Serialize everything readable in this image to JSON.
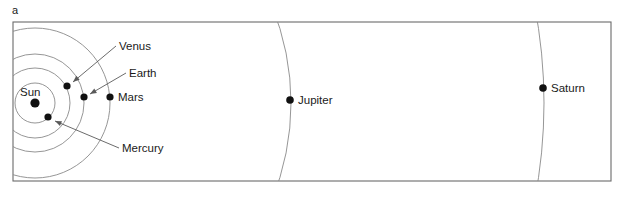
{
  "figure": {
    "panel_letter": "a",
    "width": 625,
    "height": 203,
    "background_color": "#ffffff",
    "frame": {
      "x": 13,
      "y": 22,
      "width": 598,
      "height": 159,
      "stroke_color": "#6b6b6b"
    }
  },
  "chart_data": {
    "type": "scatter",
    "title": "",
    "subtitle": "",
    "xlabel": "",
    "ylabel": "",
    "grid": false,
    "legend": "none",
    "center": {
      "name": "Sun",
      "x": 35,
      "y": 103,
      "dot_radius": 4.6
    },
    "orbit_color": "#8a8a8a",
    "dot_color": "#111111",
    "bodies": [
      {
        "name": "Mercury",
        "orbit_radius": 20,
        "x": 48,
        "y": 117,
        "dot_radius": 3.6,
        "label": "Mercury",
        "label_x": 122,
        "label_y": 152,
        "leader": {
          "x1": 119,
          "y1": 148,
          "x2": 55,
          "y2": 121
        }
      },
      {
        "name": "Venus",
        "orbit_radius": 35,
        "x": 67,
        "y": 86,
        "dot_radius": 3.6,
        "label": "Venus",
        "label_x": 119,
        "label_y": 50,
        "leader": {
          "x1": 116,
          "y1": 46,
          "x2": 73,
          "y2": 82
        }
      },
      {
        "name": "Earth",
        "orbit_radius": 49,
        "x": 84,
        "y": 97,
        "dot_radius": 3.6,
        "label": "Earth",
        "label_x": 129,
        "label_y": 77,
        "leader": {
          "x1": 126,
          "y1": 73,
          "x2": 90,
          "y2": 94
        }
      },
      {
        "name": "Mars",
        "orbit_radius": 75,
        "x": 110,
        "y": 97,
        "dot_radius": 3.6,
        "label": "Mars",
        "label_x": 118,
        "label_y": 101,
        "leader": null
      },
      {
        "name": "Jupiter",
        "orbit_radius": 256,
        "x": 290,
        "y": 100,
        "dot_radius": 3.8,
        "label": "Jupiter",
        "label_x": 298,
        "label_y": 104,
        "leader": null
      },
      {
        "name": "Saturn",
        "orbit_radius": 509,
        "x": 543,
        "y": 88,
        "dot_radius": 3.8,
        "label": "Saturn",
        "label_x": 551,
        "label_y": 92,
        "leader": null
      }
    ],
    "sun_label": {
      "text": "Sun",
      "label_x": 20,
      "label_y": 96
    }
  }
}
